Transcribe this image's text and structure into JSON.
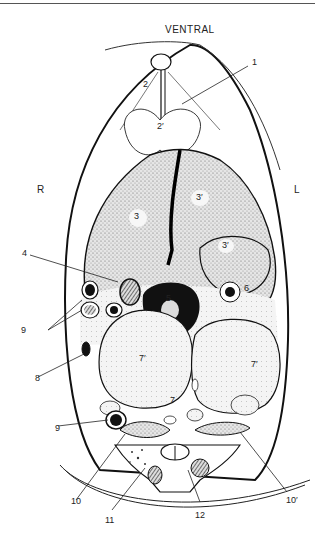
{
  "figure": {
    "type": "anatomical cross-section",
    "orientation": {
      "top": "VENTRAL",
      "left": "R",
      "right": "L"
    },
    "labels": [
      {
        "id": "1",
        "text": "1"
      },
      {
        "id": "2",
        "text": "2"
      },
      {
        "id": "2p",
        "text": "2′"
      },
      {
        "id": "3",
        "text": "3"
      },
      {
        "id": "3p_a",
        "text": "3′"
      },
      {
        "id": "3p_b",
        "text": "3′"
      },
      {
        "id": "4",
        "text": "4"
      },
      {
        "id": "5",
        "text": "5"
      },
      {
        "id": "6",
        "text": "6"
      },
      {
        "id": "7",
        "text": "7"
      },
      {
        "id": "7p_a",
        "text": "7′"
      },
      {
        "id": "7p_b",
        "text": "7′"
      },
      {
        "id": "8",
        "text": "8"
      },
      {
        "id": "9a",
        "text": "9"
      },
      {
        "id": "9b",
        "text": "9"
      },
      {
        "id": "10",
        "text": "10"
      },
      {
        "id": "10p",
        "text": "10′"
      },
      {
        "id": "11",
        "text": "11"
      },
      {
        "id": "12",
        "text": "12"
      }
    ]
  }
}
